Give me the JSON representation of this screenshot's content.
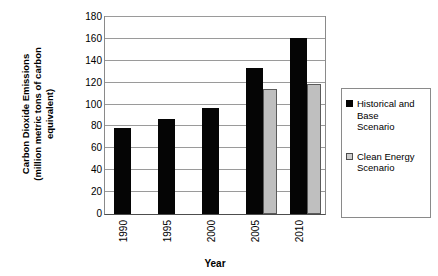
{
  "chart_data": {
    "type": "bar",
    "title": "",
    "xlabel": "Year",
    "ylabel_lines": [
      "Carbon Dioxide Emissions",
      "(million metric tons of carbon",
      "equivalent)"
    ],
    "ylabel": "Carbon Dioxide Emissions (million metric tons of carbon equivalent)",
    "categories": [
      "1990",
      "1995",
      "2000",
      "2005",
      "2010"
    ],
    "series": [
      {
        "name": "Historical and Base Scenario",
        "name_lines": [
          "Historical and",
          "Base",
          "Scenario"
        ],
        "color": "#050505",
        "values": [
          79,
          87,
          97,
          133,
          161
        ]
      },
      {
        "name": "Clean Energy Scenario",
        "name_lines": [
          "Clean Energy",
          "Scenario"
        ],
        "color": "#bfbfbf",
        "values": [
          null,
          null,
          null,
          114,
          119
        ]
      }
    ],
    "ylim": [
      0,
      180
    ],
    "yticks": [
      0,
      20,
      40,
      60,
      80,
      100,
      120,
      140,
      160,
      180
    ],
    "grid": true,
    "legend_position": "right"
  },
  "legend": {
    "items": [
      {
        "label": "Historical and Base Scenario",
        "swatch": "black-square-icon"
      },
      {
        "label": "Clean Energy Scenario",
        "swatch": "gray-square-icon"
      }
    ]
  }
}
